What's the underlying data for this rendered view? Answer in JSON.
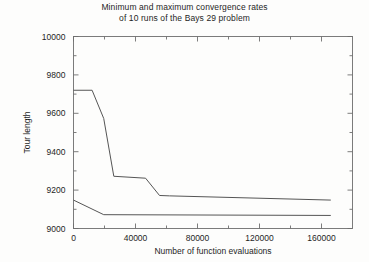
{
  "chart_data": {
    "type": "line",
    "title": "Minimum and maximum convergence rates\nof 10 runs of the Bays 29 problem",
    "title_line1": "Minimum and maximum convergence rates",
    "title_line2": "of 10 runs of the Bays 29 problem",
    "xlabel": "Number of function evaluations",
    "ylabel": "Tour length",
    "xlim": [
      0,
      180000
    ],
    "ylim": [
      9000,
      10000
    ],
    "xticks": [
      0,
      40000,
      80000,
      120000,
      160000
    ],
    "xticklabels": [
      "0",
      "40000",
      "80000",
      "120000",
      "160000"
    ],
    "xminorticks": [
      20000,
      60000,
      100000,
      140000,
      180000
    ],
    "yticks": [
      9000,
      9200,
      9400,
      9600,
      9800,
      10000
    ],
    "yticklabels": [
      "9000",
      "9200",
      "9400",
      "9600",
      "9800",
      "10000"
    ],
    "yminorticks": [
      9100,
      9300,
      9500,
      9700,
      9900
    ],
    "grid": false,
    "legend": false,
    "line_color": "#555555",
    "axis_color": "#6e6e6e",
    "background": "#fdfdfc",
    "series": [
      {
        "name": "maximum",
        "x": [
          0,
          12000,
          19500,
          26000,
          46500,
          55500,
          62000,
          166000
        ],
        "values": [
          9720,
          9720,
          9573,
          9272,
          9262,
          9172,
          9170,
          9148
        ]
      },
      {
        "name": "minimum",
        "x": [
          0,
          19500,
          166000
        ],
        "values": [
          9148,
          9072,
          9068
        ]
      }
    ]
  }
}
